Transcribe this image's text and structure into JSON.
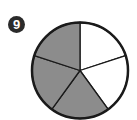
{
  "problem": {
    "number": "9"
  },
  "chart_data": {
    "type": "pie",
    "title": "",
    "total_parts": 5,
    "shaded_parts": 3,
    "fraction_shaded": "3/5",
    "slices": [
      {
        "index": 1,
        "value": 1,
        "shaded": false
      },
      {
        "index": 2,
        "value": 1,
        "shaded": false
      },
      {
        "index": 3,
        "value": 1,
        "shaded": true
      },
      {
        "index": 4,
        "value": 1,
        "shaded": true
      },
      {
        "index": 5,
        "value": 1,
        "shaded": true
      }
    ],
    "colors": {
      "shaded": "#8c8c8c",
      "unshaded": "#ffffff",
      "outline": "#1a1a1a"
    }
  }
}
